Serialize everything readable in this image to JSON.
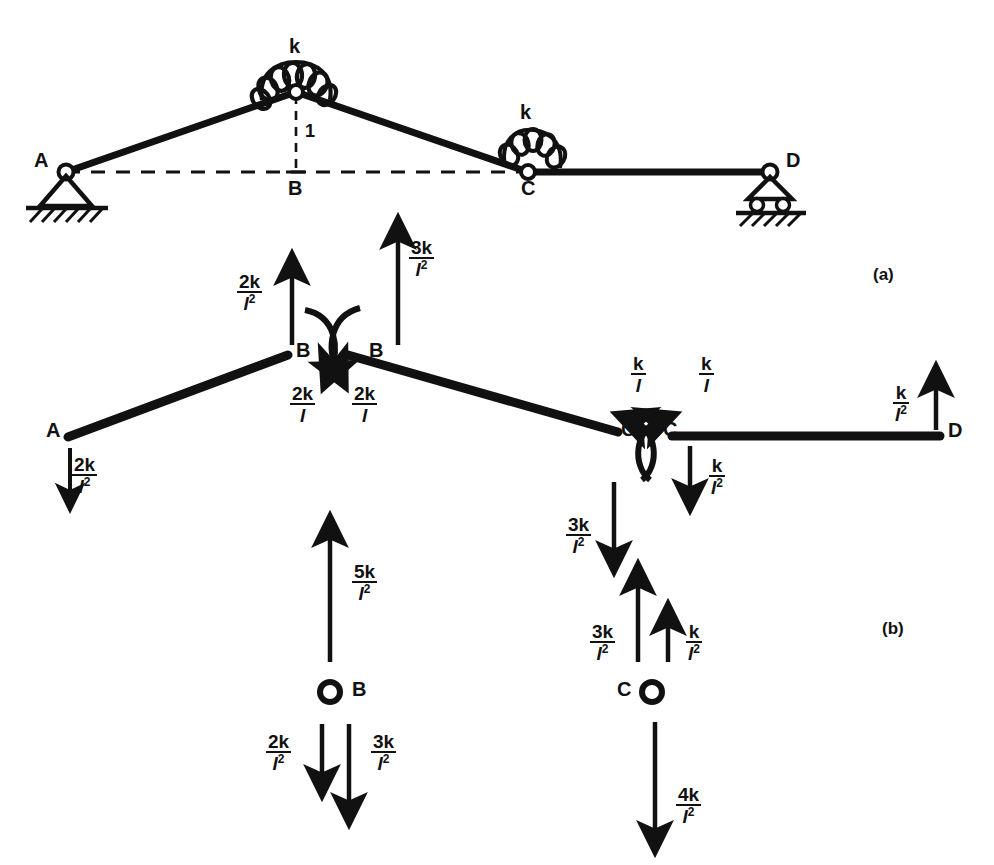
{
  "figure": {
    "part_a_label": "(a)",
    "part_b_label": "(b)"
  },
  "panel_a": {
    "spring_label_apex": "k",
    "spring_label_c": "k",
    "unit_displacement_label": "1",
    "nodes": [
      {
        "name": "A",
        "label": "A",
        "support": "pin-support"
      },
      {
        "name": "B",
        "label": "B",
        "support": "none"
      },
      {
        "name": "C",
        "label": "C",
        "support": "none"
      },
      {
        "name": "D",
        "label": "D",
        "support": "roller-support"
      }
    ]
  },
  "panel_b": {
    "nodes": [
      {
        "name": "A-left",
        "label": "A"
      },
      {
        "name": "B-left",
        "label": "B"
      },
      {
        "name": "B-right",
        "label": "B"
      },
      {
        "name": "C-left",
        "label": "C"
      },
      {
        "name": "C-right",
        "label": "C"
      },
      {
        "name": "D-right",
        "label": "D"
      },
      {
        "name": "B-joint",
        "label": "B"
      },
      {
        "name": "C-joint",
        "label": "C"
      }
    ],
    "forces": [
      {
        "id": "a-down",
        "num": "2k",
        "den": "l",
        "exp": "2",
        "dir": "down",
        "at": "A of member AB"
      },
      {
        "id": "b-left-up",
        "num": "2k",
        "den": "l",
        "exp": "2",
        "dir": "up",
        "at": "B of member AB"
      },
      {
        "id": "b-left-moment",
        "num": "2k",
        "den": "l",
        "exp": "",
        "dir": "moment-cw",
        "at": "B of member AB"
      },
      {
        "id": "b-right-up",
        "num": "3k",
        "den": "l",
        "exp": "2",
        "dir": "up",
        "at": "B of member BC"
      },
      {
        "id": "b-right-moment",
        "num": "2k",
        "den": "l",
        "exp": "",
        "dir": "moment-ccw",
        "at": "B of member BC"
      },
      {
        "id": "c-left-moment",
        "num": "k",
        "den": "l",
        "exp": "",
        "dir": "moment-ccw",
        "at": "C of member BC"
      },
      {
        "id": "c-left-down",
        "num": "3k",
        "den": "l",
        "exp": "2",
        "dir": "down",
        "at": "C of member BC"
      },
      {
        "id": "c-right-moment",
        "num": "k",
        "den": "l",
        "exp": "",
        "dir": "moment-cw",
        "at": "C of member CD"
      },
      {
        "id": "c-right-down",
        "num": "k",
        "den": "l",
        "exp": "2",
        "dir": "down",
        "at": "C of member CD"
      },
      {
        "id": "d-up",
        "num": "k",
        "den": "l",
        "exp": "2",
        "dir": "up",
        "at": "D of member CD"
      },
      {
        "id": "joint-b-up",
        "num": "5k",
        "den": "l",
        "exp": "2",
        "dir": "up",
        "at": "joint B"
      },
      {
        "id": "joint-b-down1",
        "num": "2k",
        "den": "l",
        "exp": "2",
        "dir": "down",
        "at": "joint B"
      },
      {
        "id": "joint-b-down2",
        "num": "3k",
        "den": "l",
        "exp": "2",
        "dir": "down",
        "at": "joint B"
      },
      {
        "id": "joint-c-up1",
        "num": "3k",
        "den": "l",
        "exp": "2",
        "dir": "up",
        "at": "joint C"
      },
      {
        "id": "joint-c-up2",
        "num": "k",
        "den": "l",
        "exp": "2",
        "dir": "up",
        "at": "joint C"
      },
      {
        "id": "joint-c-down",
        "num": "4k",
        "den": "l",
        "exp": "2",
        "dir": "down",
        "at": "joint C"
      }
    ]
  },
  "style": {
    "ink": "#111111",
    "paper": "#ffffff"
  }
}
